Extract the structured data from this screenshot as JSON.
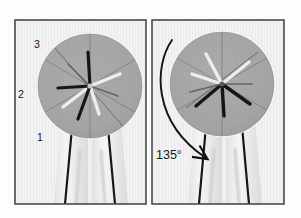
{
  "figure": {
    "caption_present": false,
    "background_color": "#fdfdfd",
    "frame_color": "#4a4a4a",
    "panel_background": "#f2f2f2",
    "disc_color": "#a6a6a6",
    "ink_color": "#1a1a1a"
  },
  "panels": [
    {
      "id": "left-panel",
      "name": "undeformed-specimen-panel",
      "labels": [
        {
          "text": "3",
          "x": 36,
          "y": 45
        },
        {
          "text": "2",
          "x": 21,
          "y": 95
        },
        {
          "text": "1",
          "x": 39,
          "y": 138
        }
      ],
      "disc": {
        "cx": 90,
        "cy": 86,
        "r": 52
      },
      "legs": [
        {
          "x_top": 72,
          "x_bottom": 66
        },
        {
          "x_top": 108,
          "x_bottom": 114
        }
      ],
      "star_rotation_deg": 0
    },
    {
      "id": "right-panel",
      "name": "rotated-specimen-panel",
      "labels": [
        {
          "text": "135°",
          "x": 158,
          "y": 157
        }
      ],
      "disc": {
        "cx": 222,
        "cy": 84,
        "r": 52
      },
      "legs": [
        {
          "x_top": 206,
          "x_bottom": 200
        },
        {
          "x_top": 242,
          "x_bottom": 248
        }
      ],
      "star_rotation_deg": 135,
      "annotation": {
        "name": "rotation-arc-arrow",
        "label": "135°",
        "angle_value": 135,
        "angle_unit": "degrees",
        "direction": "clockwise"
      }
    }
  ],
  "annotations": {
    "angle_label": "135°",
    "axis_labels": [
      "1",
      "2",
      "3"
    ]
  }
}
